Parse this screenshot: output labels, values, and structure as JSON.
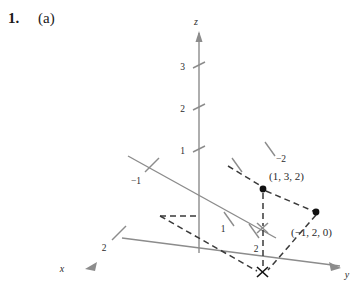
{
  "problem": {
    "number": "1.",
    "part": "(a)"
  },
  "figure": {
    "type": "3d-coordinate-axes",
    "colors": {
      "axis": "#8c8c8c",
      "dashed": "#3a3a3a",
      "text": "#2b2b2b",
      "point": "#111111",
      "background": "#ffffff"
    },
    "axes": [
      {
        "name": "x",
        "label": "x",
        "label_x": 60,
        "label_y": 268,
        "arrow": "down-left"
      },
      {
        "name": "y",
        "label": "y",
        "label_x": 345,
        "label_y": 277,
        "arrow": "down-right"
      },
      {
        "name": "z",
        "label": "z",
        "label_x": 196,
        "label_y": 25,
        "arrow": "up"
      }
    ],
    "ticks": [
      {
        "axis": "z",
        "label": "3",
        "x": 183,
        "y": 69
      },
      {
        "axis": "z",
        "label": "2",
        "x": 183,
        "y": 111
      },
      {
        "axis": "z",
        "label": "1",
        "x": 183,
        "y": 153
      },
      {
        "axis": "x",
        "label": "2",
        "x": 101,
        "y": 248
      },
      {
        "axis": "x-negative",
        "label": "−1",
        "x": 131,
        "y": 182
      },
      {
        "axis": "y",
        "label": "1",
        "x": 222,
        "y": 230
      },
      {
        "axis": "y",
        "label": "2",
        "x": 257,
        "y": 250
      },
      {
        "axis": "y-negative",
        "label": "−2",
        "x": 278,
        "y": 160
      }
    ],
    "points": [
      {
        "name": "point-1-3-2",
        "label": "(1, 3, 2)",
        "label_x": 269,
        "label_y": 180,
        "dot_x": 263,
        "dot_y": 189,
        "marker": "filled-circle"
      },
      {
        "name": "point-neg1-2-0",
        "label": "(−1, 2, 0)",
        "label_x": 292,
        "label_y": 234,
        "dot_x": 316,
        "dot_y": 212,
        "marker": "filled-circle"
      }
    ],
    "markers": [
      {
        "name": "projection-cross",
        "x": 262,
        "y": 272,
        "marker": "x-cross"
      },
      {
        "name": "base-cross",
        "x": 243,
        "y": 228,
        "marker": "x-cross"
      }
    ]
  }
}
